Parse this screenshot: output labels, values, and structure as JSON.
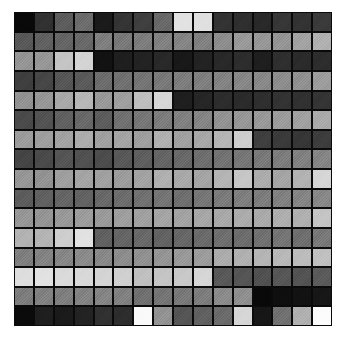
{
  "figure": {
    "title": "",
    "background_color": "#ffffff",
    "gridline_color": "#0a0a0a"
  },
  "chart_data": {
    "type": "heatmap",
    "title": "",
    "subtitle": "",
    "xlabel": "",
    "ylabel": "",
    "rows": 16,
    "cols": 16,
    "colormap": "gray",
    "value_range": [
      0,
      255
    ],
    "grid": true,
    "legend": "none",
    "x_tick_labels": [],
    "y_tick_labels": [],
    "annotations": [],
    "values": [
      [
        8,
        48,
        92,
        108,
        26,
        52,
        62,
        104,
        226,
        224,
        50,
        46,
        40,
        54,
        50,
        58
      ],
      [
        88,
        96,
        100,
        104,
        126,
        120,
        124,
        128,
        132,
        128,
        140,
        152,
        150,
        148,
        162,
        176
      ],
      [
        148,
        150,
        196,
        212,
        18,
        30,
        34,
        40,
        24,
        34,
        40,
        44,
        30,
        46,
        42,
        44
      ],
      [
        62,
        70,
        86,
        90,
        108,
        112,
        116,
        120,
        124,
        126,
        130,
        134,
        136,
        140,
        144,
        156
      ],
      [
        146,
        150,
        168,
        182,
        152,
        158,
        190,
        214,
        30,
        38,
        44,
        42,
        46,
        50,
        48,
        52
      ],
      [
        74,
        82,
        96,
        104,
        92,
        112,
        118,
        124,
        128,
        132,
        146,
        150,
        152,
        156,
        160,
        170
      ],
      [
        156,
        158,
        162,
        172,
        160,
        164,
        158,
        176,
        160,
        166,
        180,
        206,
        62,
        58,
        54,
        60
      ],
      [
        68,
        74,
        84,
        80,
        76,
        88,
        94,
        100,
        104,
        110,
        114,
        118,
        120,
        124,
        128,
        132
      ],
      [
        150,
        146,
        158,
        164,
        160,
        156,
        162,
        176,
        168,
        164,
        180,
        198,
        172,
        164,
        178,
        214
      ],
      [
        92,
        96,
        100,
        98,
        104,
        108,
        112,
        116,
        110,
        118,
        122,
        126,
        124,
        128,
        132,
        136
      ],
      [
        150,
        148,
        152,
        156,
        154,
        158,
        160,
        164,
        162,
        166,
        168,
        172,
        170,
        174,
        176,
        196
      ],
      [
        178,
        180,
        206,
        226,
        96,
        100,
        104,
        98,
        102,
        106,
        110,
        108,
        112,
        116,
        110,
        120
      ],
      [
        126,
        130,
        134,
        138,
        136,
        140,
        144,
        148,
        152,
        156,
        172,
        176,
        180,
        184,
        188,
        192
      ],
      [
        222,
        226,
        218,
        216,
        212,
        208,
        192,
        196,
        200,
        214,
        88,
        84,
        80,
        86,
        82,
        90
      ],
      [
        124,
        128,
        126,
        130,
        132,
        128,
        112,
        116,
        120,
        124,
        138,
        142,
        8,
        14,
        18,
        22
      ],
      [
        10,
        30,
        26,
        34,
        48,
        44,
        250,
        146,
        84,
        96,
        106,
        214,
        22,
        112,
        176,
        252
      ]
    ]
  }
}
